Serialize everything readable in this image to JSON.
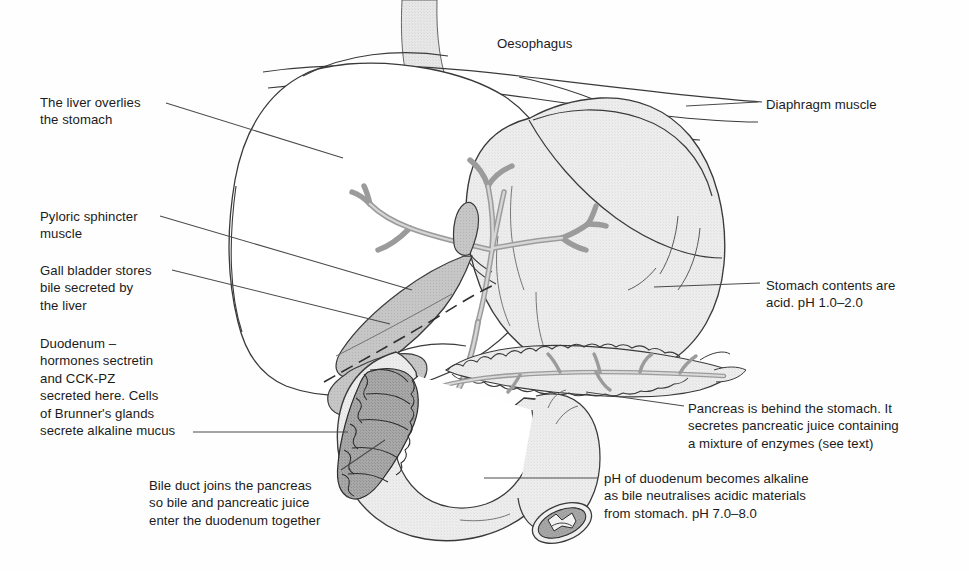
{
  "figure": {
    "colors": {
      "ink": "#1b1b1b",
      "leader_line": "#4a4a4a",
      "organ_outline": "#3a3a3a",
      "pale_fill": "#ececec",
      "stomach_fill": "#e8e8e8",
      "duct_fill": "#c9c9c9",
      "gallbladder_fill": "#b9b9b9",
      "mucosa_fill": "#9a9a9a",
      "background": "#ffffff"
    }
  },
  "labels": {
    "oesophagus": {
      "text": "Oesophagus",
      "x": 497,
      "y": 35
    },
    "diaphragm": {
      "text": "Diaphragm muscle",
      "x": 766,
      "y": 96
    },
    "liver": {
      "text": "The liver overlies\nthe stomach",
      "x": 40,
      "y": 94
    },
    "pyloric_sphincter": {
      "text": "Pyloric sphincter\nmuscle",
      "x": 40,
      "y": 208
    },
    "gall_bladder": {
      "text": "Gall bladder stores\nbile secreted by\nthe liver",
      "x": 40,
      "y": 262
    },
    "duodenum_hormones": {
      "text": "Duodenum –\nhormones sectretin\nand CCK-PZ\nsecreted here. Cells\nof Brunner's glands\nsecrete alkaline mucus",
      "x": 40,
      "y": 335
    },
    "bile_duct": {
      "text": "Bile duct joins the pancreas\nso bile and pancreatic juice\nenter the duodenum together",
      "x": 149,
      "y": 477
    },
    "stomach_contents": {
      "text": "Stomach contents are\nacid. pH 1.0–2.0",
      "x": 766,
      "y": 277
    },
    "pancreas": {
      "text": "Pancreas is behind the stomach. It\nsecretes pancreatic juice containing\na mixture of enzymes (see text)",
      "x": 688,
      "y": 400
    },
    "ph_duodenum": {
      "text": "pH of duodenum becomes alkaline\nas bile neutralises acidic materials\nfrom stomach. pH 7.0–8.0",
      "x": 604,
      "y": 470
    }
  },
  "structures": {
    "oesophagus": "oesophagus-tube",
    "diaphragm": "diaphragm-muscle-lines",
    "liver": "liver-lobe-outline",
    "stomach": "stomach-body",
    "gall_bladder": "gall-bladder",
    "bile_duct_tree": "hepatic-bile-duct-tree",
    "common_bile_duct": "common-bile-duct",
    "pancreas": "pancreas-gland",
    "pancreatic_duct": "pancreatic-duct",
    "duodenum": "duodenum-c-loop",
    "duodenal_mucosa": "duodenal-mucosal-folds",
    "jejunum_cut_end": "cut-end-cross-section",
    "pyloric_sphincter": "pyloric-sphincter-region"
  }
}
